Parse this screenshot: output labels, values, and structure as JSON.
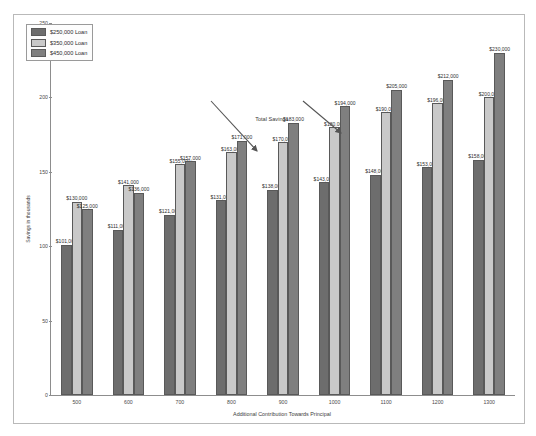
{
  "chart_data": {
    "type": "bar",
    "title": "Total Savings in Mortgage By adding Extra $",
    "xlabel": "Additional Contribution Towards Principal",
    "ylabel": "Savings in thousands",
    "categories": [
      "500",
      "600",
      "700",
      "800",
      "900",
      "1000",
      "1100",
      "1200",
      "1300"
    ],
    "ylim": [
      0,
      250
    ],
    "yticks": [
      0,
      50,
      100,
      150,
      200,
      250
    ],
    "grid": false,
    "legend_position": "top-left",
    "series": [
      {
        "name": "$250,000 Loan",
        "color": "#6d6d6d",
        "values": [
          101,
          111,
          121,
          131,
          138,
          143,
          148,
          153,
          158
        ],
        "labels": [
          "$101,000",
          "$111,000",
          "$121,000",
          "$131,000",
          "$138,000",
          "$143,000",
          "$148,000",
          "$153,000",
          "$158,000"
        ]
      },
      {
        "name": "$350,000 Loan",
        "color": "#c9c9c9",
        "values": [
          130,
          141,
          155,
          163,
          170,
          180,
          190,
          196,
          200
        ],
        "labels": [
          "$130,000",
          "$141,000",
          "$155,000",
          "$163,000",
          "$170,000",
          "$180,000",
          "$190,000",
          "$196,000",
          "$200,000"
        ]
      },
      {
        "name": "$450,000 Loan",
        "color": "#7f7f7f",
        "values": [
          125,
          136,
          157,
          171,
          183,
          194,
          205,
          212,
          230
        ],
        "labels": [
          "$125,000",
          "$136,000",
          "$157,000",
          "$171,000",
          "$183,000",
          "$194,000",
          "$205,000",
          "$212,000",
          "$230,000"
        ]
      }
    ],
    "annotations": [
      {
        "text": "Total Savings",
        "x": 0.44,
        "y": 0.25
      }
    ]
  }
}
